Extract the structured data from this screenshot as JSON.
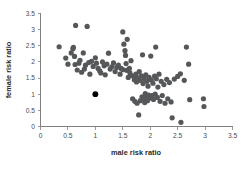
{
  "chart_data": {
    "type": "scatter",
    "title": "",
    "xlabel": "male risk ratio",
    "ylabel": "female risk ratio",
    "xlim": [
      0,
      3.5
    ],
    "ylim": [
      0,
      3.5
    ],
    "xticks": [
      "0",
      "0.5",
      "1",
      "1.5",
      "2",
      "2.5",
      "3",
      "3.5"
    ],
    "yticks": [
      "0",
      "0.5",
      "1",
      "1.5",
      "2",
      "2.5",
      "3",
      "3.5"
    ],
    "xtick_values": [
      0,
      0.5,
      1,
      1.5,
      2,
      2.5,
      3,
      3.5
    ],
    "ytick_values": [
      0,
      0.5,
      1,
      1.5,
      2,
      2.5,
      3,
      3.5
    ],
    "grid": false,
    "legend": "none",
    "marker_color": "#555759",
    "highlight_color": "#000000",
    "marker_size": 2.6,
    "series": [
      {
        "name": "studies",
        "points": [
          [
            0.34,
            2.47
          ],
          [
            0.46,
            2.12
          ],
          [
            0.5,
            1.93
          ],
          [
            0.56,
            2.28
          ],
          [
            0.59,
            2.41
          ],
          [
            0.6,
            2.45
          ],
          [
            0.62,
            2.17
          ],
          [
            0.64,
            3.13
          ],
          [
            0.63,
            1.92
          ],
          [
            0.67,
            1.75
          ],
          [
            0.7,
            1.96
          ],
          [
            0.72,
            2.05
          ],
          [
            0.75,
            1.68
          ],
          [
            0.78,
            2.28
          ],
          [
            0.8,
            1.78
          ],
          [
            0.82,
            1.9
          ],
          [
            0.85,
            3.1
          ],
          [
            0.88,
            1.98
          ],
          [
            0.9,
            1.62
          ],
          [
            0.93,
            2.02
          ],
          [
            0.96,
            1.86
          ],
          [
            1.0,
            2.13
          ],
          [
            1.02,
            1.96
          ],
          [
            1.05,
            1.8
          ],
          [
            1.08,
            1.72
          ],
          [
            1.1,
            1.66
          ],
          [
            1.13,
            2.0
          ],
          [
            1.16,
            1.88
          ],
          [
            1.18,
            1.6
          ],
          [
            1.21,
            1.93
          ],
          [
            1.24,
            2.27
          ],
          [
            1.27,
            1.78
          ],
          [
            1.3,
            1.85
          ],
          [
            1.33,
            1.97
          ],
          [
            1.36,
            1.7
          ],
          [
            1.39,
            1.83
          ],
          [
            1.42,
            1.9
          ],
          [
            1.45,
            1.62
          ],
          [
            1.47,
            1.8
          ],
          [
            1.5,
            2.93
          ],
          [
            1.5,
            1.76
          ],
          [
            1.52,
            2.55
          ],
          [
            1.54,
            2.35
          ],
          [
            1.55,
            2.2
          ],
          [
            1.56,
            1.95
          ],
          [
            1.57,
            1.74
          ],
          [
            1.58,
            2.7
          ],
          [
            1.6,
            1.52
          ],
          [
            1.62,
            1.8
          ],
          [
            1.63,
            1.66
          ],
          [
            1.65,
            2.04
          ],
          [
            1.66,
            1.58
          ],
          [
            1.68,
            0.86
          ],
          [
            1.7,
            1.55
          ],
          [
            1.71,
            1.45
          ],
          [
            1.72,
            0.78
          ],
          [
            1.74,
            1.62
          ],
          [
            1.75,
            1.38
          ],
          [
            1.76,
            0.72
          ],
          [
            1.78,
            1.5
          ],
          [
            1.79,
            0.36
          ],
          [
            1.8,
            1.7
          ],
          [
            1.81,
            1.43
          ],
          [
            1.82,
            0.8
          ],
          [
            1.84,
            1.57
          ],
          [
            1.85,
            0.92
          ],
          [
            1.86,
            2.22
          ],
          [
            1.87,
            1.33
          ],
          [
            1.88,
            0.86
          ],
          [
            1.89,
            1.48
          ],
          [
            1.9,
            0.74
          ],
          [
            1.91,
            1.02
          ],
          [
            1.92,
            1.6
          ],
          [
            1.93,
            0.94
          ],
          [
            1.94,
            1.4
          ],
          [
            1.95,
            0.8
          ],
          [
            1.96,
            1.25
          ],
          [
            1.97,
            0.97
          ],
          [
            1.98,
            1.52
          ],
          [
            2.0,
            0.88
          ],
          [
            2.01,
            2.18
          ],
          [
            2.02,
            1.44
          ],
          [
            2.03,
            0.96
          ],
          [
            2.05,
            1.34
          ],
          [
            2.06,
            0.84
          ],
          [
            2.08,
            1.56
          ],
          [
            2.09,
            1.0
          ],
          [
            2.1,
            2.46
          ],
          [
            2.11,
            1.48
          ],
          [
            2.13,
            0.9
          ],
          [
            2.14,
            1.22
          ],
          [
            2.16,
            1.62
          ],
          [
            2.18,
            0.78
          ],
          [
            2.2,
            1.4
          ],
          [
            2.22,
            0.96
          ],
          [
            2.25,
            1.3
          ],
          [
            2.27,
            0.72
          ],
          [
            2.3,
            1.46
          ],
          [
            2.32,
            0.86
          ],
          [
            2.35,
            1.36
          ],
          [
            2.38,
            0.76
          ],
          [
            2.4,
            0.27
          ],
          [
            2.44,
            1.47
          ],
          [
            2.5,
            1.55
          ],
          [
            2.55,
            1.63
          ],
          [
            2.56,
            0.13
          ],
          [
            2.62,
            1.43
          ],
          [
            2.66,
            2.46
          ],
          [
            2.7,
            1.93
          ],
          [
            2.72,
            0.83
          ],
          [
            2.97,
            0.86
          ],
          [
            2.98,
            0.62
          ]
        ]
      }
    ],
    "highlight_point": [
      1.0,
      1.0
    ],
    "n_points": 114
  }
}
